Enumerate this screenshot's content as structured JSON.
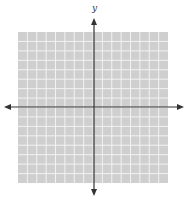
{
  "diagram": {
    "type": "coordinate-plane",
    "y_axis_label": "y",
    "x_axis_label": "x",
    "grid": {
      "columns": 16,
      "rows": 16,
      "left": 18,
      "top": 32,
      "right": 168,
      "bottom": 183,
      "fill_color": "#cfcfcf",
      "line_color": "#f2f2f2"
    },
    "axes": {
      "origin_x": 94,
      "origin_y": 107,
      "x_start": 4,
      "x_end": 184,
      "y_start": 18,
      "y_end": 196,
      "color": "#333333"
    }
  }
}
